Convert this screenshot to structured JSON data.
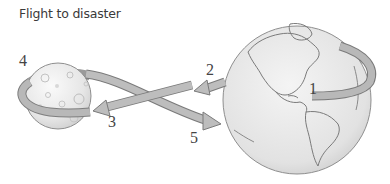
{
  "title": "Flight to disaster",
  "labels": [
    {
      "id": "1",
      "text": "1"
    },
    {
      "id": "2",
      "text": "2"
    },
    {
      "id": "3",
      "text": "3"
    },
    {
      "id": "4",
      "text": "4"
    },
    {
      "id": "5",
      "text": "5"
    }
  ],
  "bodies": {
    "moon": "moon",
    "earth": "earth"
  },
  "colors": {
    "arrow": "#b3b3b3",
    "arrow_edge": "#7a7a7a",
    "sphere": "#ececec",
    "outline": "#8a8a8a"
  }
}
